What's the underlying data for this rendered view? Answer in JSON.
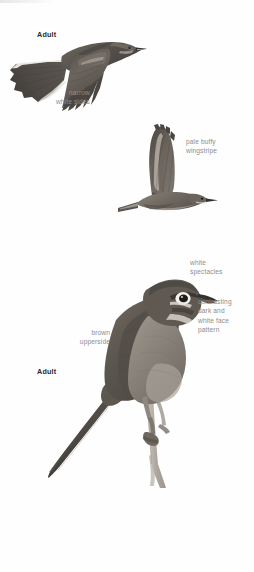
{
  "plate": {
    "background_color": "#fefefe",
    "figure_count": 3,
    "subject": "bird-illustration-plate"
  },
  "figures": [
    {
      "id": "flying-bird-upper",
      "pose": "flight-from-below-spread-tail",
      "age_label": "Adult"
    },
    {
      "id": "flying-bird-middle",
      "pose": "flight-side-wings-raised",
      "age_label": ""
    },
    {
      "id": "perched-bird",
      "pose": "perched-on-branch-facing-right",
      "age_label": "Adult"
    }
  ],
  "age_labels": {
    "upper": "Adult",
    "lower": "Adult"
  },
  "annotations": [
    {
      "id": "narrow-white-sides",
      "text": "narrow\nwhite sides",
      "align": "right"
    },
    {
      "id": "pale-buffy-wingstripe",
      "text": "pale buffy\nwingstripe",
      "align": "left"
    },
    {
      "id": "white-spectacles",
      "text": "white\nspectacles",
      "align": "left"
    },
    {
      "id": "contrasting-face-pattern",
      "text": "contrasting\ndark and\nwhite face\npattern",
      "align": "left"
    },
    {
      "id": "brown-upperside",
      "text": "brown\nupperside",
      "align": "right"
    }
  ],
  "colors": {
    "annotation_text": "#8d8d8d",
    "age_text": "#2a2a2a",
    "plumage_dark": "#4a4643",
    "plumage_mid": "#6f6a64",
    "plumage_light": "#a39c94",
    "plumage_pale": "#d8d3cc",
    "white_marking": "#f4f2ef",
    "branch": "#b3aea6",
    "bill_dark": "#37332f",
    "eye": "#1c1a18"
  }
}
